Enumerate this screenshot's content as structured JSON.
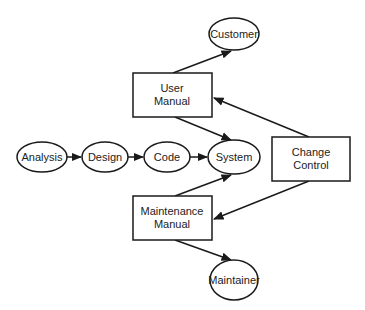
{
  "diagram": {
    "nodes": {
      "analysis": {
        "label": "Analysis",
        "shape": "ellipse"
      },
      "design": {
        "label": "Design",
        "shape": "ellipse"
      },
      "code": {
        "label": "Code",
        "shape": "ellipse"
      },
      "system": {
        "label": "System",
        "shape": "ellipse"
      },
      "customer": {
        "label": "Customer",
        "shape": "ellipse"
      },
      "maintainer": {
        "label": "Maintainer",
        "shape": "ellipse"
      },
      "user_manual": {
        "label_line1": "User",
        "label_line2": "Manual",
        "shape": "rectangle"
      },
      "maintenance_manual": {
        "label_line1": "Maintenance",
        "label_line2": "Manual",
        "shape": "rectangle"
      },
      "change_control": {
        "label_line1": "Change",
        "label_line2": "Control",
        "shape": "rectangle"
      }
    },
    "edges": [
      {
        "from": "analysis",
        "to": "design"
      },
      {
        "from": "design",
        "to": "code"
      },
      {
        "from": "code",
        "to": "system"
      },
      {
        "from": "user_manual",
        "to": "customer"
      },
      {
        "from": "user_manual",
        "to": "system"
      },
      {
        "from": "maintenance_manual",
        "to": "system"
      },
      {
        "from": "maintenance_manual",
        "to": "maintainer"
      },
      {
        "from": "change_control",
        "to": "user_manual"
      },
      {
        "from": "change_control",
        "to": "maintenance_manual"
      }
    ],
    "colors": {
      "stroke": "#1a1a1a",
      "text": "#222222",
      "background": "#ffffff"
    }
  }
}
